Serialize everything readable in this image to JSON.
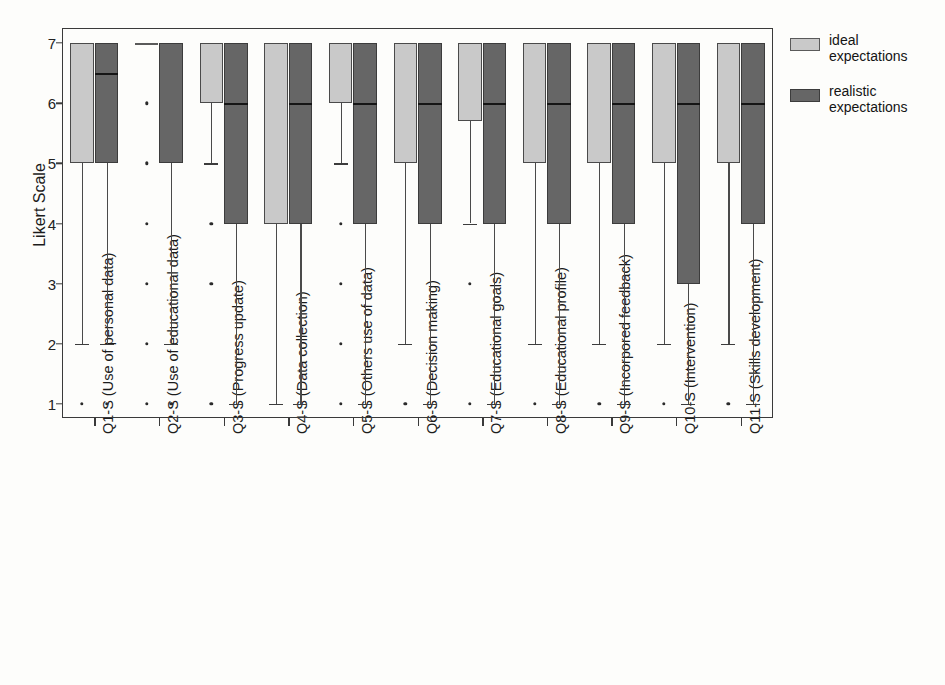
{
  "chart_data": {
    "type": "box",
    "title": "",
    "xlabel": "",
    "ylabel": "Likert Scale",
    "ylim": [
      1,
      7
    ],
    "yticks": [
      7,
      6,
      5,
      4,
      3,
      2,
      1
    ],
    "grid": false,
    "legend_position": "right",
    "colors": {
      "ideal": "#c9c9c9",
      "realistic": "#666666",
      "axis": "#3a3a3a"
    },
    "legend": [
      {
        "key": "ideal",
        "line1": "ideal",
        "line2": "expectations",
        "swatch": "#c9c9c9"
      },
      {
        "key": "realistic",
        "line1": "realistic",
        "line2": "expectations",
        "swatch": "#666666"
      }
    ],
    "categories": [
      "Q1-S (Use of personal data)",
      "Q2-S (Use of educational data)",
      "Q3-S (Progress update)",
      "Q4-S (Data collection)",
      "Q5-S (Others use of data)",
      "Q6-S (Decision making)",
      "Q7-S (Educational goals)",
      "Q8-S (Educational profile)",
      "Q9-S (Incorpored feedback)",
      "Q10-S (Intervention)",
      "Q11-S (Skills development)"
    ],
    "series": [
      {
        "name": "ideal expectations",
        "boxes": [
          {
            "q1": 5,
            "median": 7,
            "q3": 7,
            "whisker_low": 2,
            "whisker_high": 7,
            "outliers": [
              1
            ]
          },
          {
            "q1": 7,
            "median": 7,
            "q3": 7,
            "whisker_low": 7,
            "whisker_high": 7,
            "outliers": [
              6,
              5,
              4,
              3,
              2,
              1
            ]
          },
          {
            "q1": 6,
            "median": 7,
            "q3": 7,
            "whisker_low": 5,
            "whisker_high": 7,
            "outliers": [
              4,
              3,
              1
            ]
          },
          {
            "q1": 4,
            "median": 7,
            "q3": 7,
            "whisker_low": 1,
            "whisker_high": 7,
            "outliers": []
          },
          {
            "q1": 6,
            "median": 7,
            "q3": 7,
            "whisker_low": 5,
            "whisker_high": 7,
            "outliers": [
              4,
              3,
              2,
              1
            ]
          },
          {
            "q1": 5,
            "median": 7,
            "q3": 7,
            "whisker_low": 2,
            "whisker_high": 7,
            "outliers": [
              1
            ]
          },
          {
            "q1": 5.7,
            "median": 7,
            "q3": 7,
            "whisker_low": 4,
            "whisker_high": 7,
            "outliers": [
              3,
              1
            ]
          },
          {
            "q1": 5,
            "median": 7,
            "q3": 7,
            "whisker_low": 2,
            "whisker_high": 7,
            "outliers": [
              1
            ]
          },
          {
            "q1": 5,
            "median": 7,
            "q3": 7,
            "whisker_low": 2,
            "whisker_high": 7,
            "outliers": [
              1
            ]
          },
          {
            "q1": 5,
            "median": 7,
            "q3": 7,
            "whisker_low": 2,
            "whisker_high": 7,
            "outliers": [
              1
            ]
          },
          {
            "q1": 5,
            "median": 7,
            "q3": 7,
            "whisker_low": 2,
            "whisker_high": 7,
            "outliers": [
              1
            ]
          }
        ]
      },
      {
        "name": "realistic expectations",
        "boxes": [
          {
            "q1": 5,
            "median": 6.5,
            "q3": 7,
            "whisker_low": 2,
            "whisker_high": 7,
            "outliers": [
              1
            ]
          },
          {
            "q1": 5,
            "median": 7,
            "q3": 7,
            "whisker_low": 2,
            "whisker_high": 7,
            "outliers": [
              1
            ]
          },
          {
            "q1": 4,
            "median": 6,
            "q3": 7,
            "whisker_low": 1,
            "whisker_high": 7,
            "outliers": []
          },
          {
            "q1": 4,
            "median": 6,
            "q3": 7,
            "whisker_low": 1,
            "whisker_high": 7,
            "outliers": []
          },
          {
            "q1": 4,
            "median": 6,
            "q3": 7,
            "whisker_low": 1,
            "whisker_high": 7,
            "outliers": []
          },
          {
            "q1": 4,
            "median": 6,
            "q3": 7,
            "whisker_low": 1,
            "whisker_high": 7,
            "outliers": []
          },
          {
            "q1": 4,
            "median": 6,
            "q3": 7,
            "whisker_low": 1,
            "whisker_high": 7,
            "outliers": []
          },
          {
            "q1": 4,
            "median": 6,
            "q3": 7,
            "whisker_low": 1,
            "whisker_high": 7,
            "outliers": []
          },
          {
            "q1": 4,
            "median": 6,
            "q3": 7,
            "whisker_low": 1,
            "whisker_high": 7,
            "outliers": []
          },
          {
            "q1": 3,
            "median": 6,
            "q3": 7,
            "whisker_low": 1,
            "whisker_high": 7,
            "outliers": []
          },
          {
            "q1": 4,
            "median": 6,
            "q3": 7,
            "whisker_low": 1,
            "whisker_high": 7,
            "outliers": []
          }
        ]
      }
    ]
  }
}
